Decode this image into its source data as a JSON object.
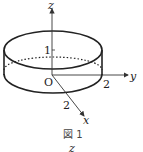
{
  "figure": {
    "caption": "図 1",
    "next_label": "z",
    "axes": {
      "x_label": "x",
      "y_label": "y",
      "z_label": "z",
      "origin_label": "O"
    },
    "ticks": {
      "z_tick": "1",
      "y_tick": "2",
      "x_tick": "2"
    },
    "shape": "cylinder",
    "colors": {
      "stroke": "#222222"
    }
  }
}
